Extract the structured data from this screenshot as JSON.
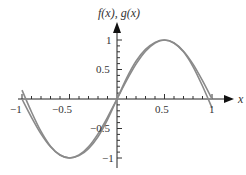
{
  "chart_data": {
    "type": "line",
    "title": "",
    "xlabel": "x",
    "ylabel": "f(x), g(x)",
    "xlim": [
      -1,
      1
    ],
    "ylim": [
      -1,
      1
    ],
    "x_ticks": [
      -1,
      -0.5,
      0.5,
      1
    ],
    "x_tick_labels": [
      "−1",
      "−0.5",
      "0.5",
      "1"
    ],
    "y_ticks": [
      1,
      0.5,
      -0.5,
      -1
    ],
    "y_tick_labels": [
      "1",
      "0.5",
      "−0.5",
      "−1"
    ],
    "grid": false,
    "legend": null,
    "series": [
      {
        "name": "f(x)",
        "x": [
          -1,
          -0.9,
          -0.8,
          -0.7,
          -0.6,
          -0.5,
          -0.4,
          -0.3,
          -0.2,
          -0.1,
          0,
          0.1,
          0.2,
          0.3,
          0.4,
          0.5,
          0.6,
          0.7,
          0.8,
          0.9,
          1
        ],
        "values": [
          0,
          -0.31,
          -0.59,
          -0.81,
          -0.95,
          -1,
          -0.95,
          -0.81,
          -0.59,
          -0.31,
          0,
          0.31,
          0.59,
          0.81,
          0.95,
          1,
          0.95,
          0.81,
          0.59,
          0.31,
          0
        ]
      },
      {
        "name": "g(x)",
        "x": [
          -1,
          -0.9,
          -0.8,
          -0.7,
          -0.6,
          -0.5,
          -0.4,
          -0.3,
          -0.2,
          -0.1,
          0,
          0.1,
          0.2,
          0.3,
          0.4,
          0.5,
          0.6,
          0.7,
          0.8,
          0.9,
          1
        ],
        "values": [
          0.15,
          -0.22,
          -0.55,
          -0.8,
          -0.95,
          -1,
          -0.96,
          -0.84,
          -0.64,
          -0.35,
          0,
          0.35,
          0.64,
          0.84,
          0.96,
          1,
          0.95,
          0.8,
          0.55,
          0.22,
          -0.15
        ]
      }
    ],
    "colors": {
      "curve": "#8a8a8a",
      "axis": "#222222"
    }
  }
}
